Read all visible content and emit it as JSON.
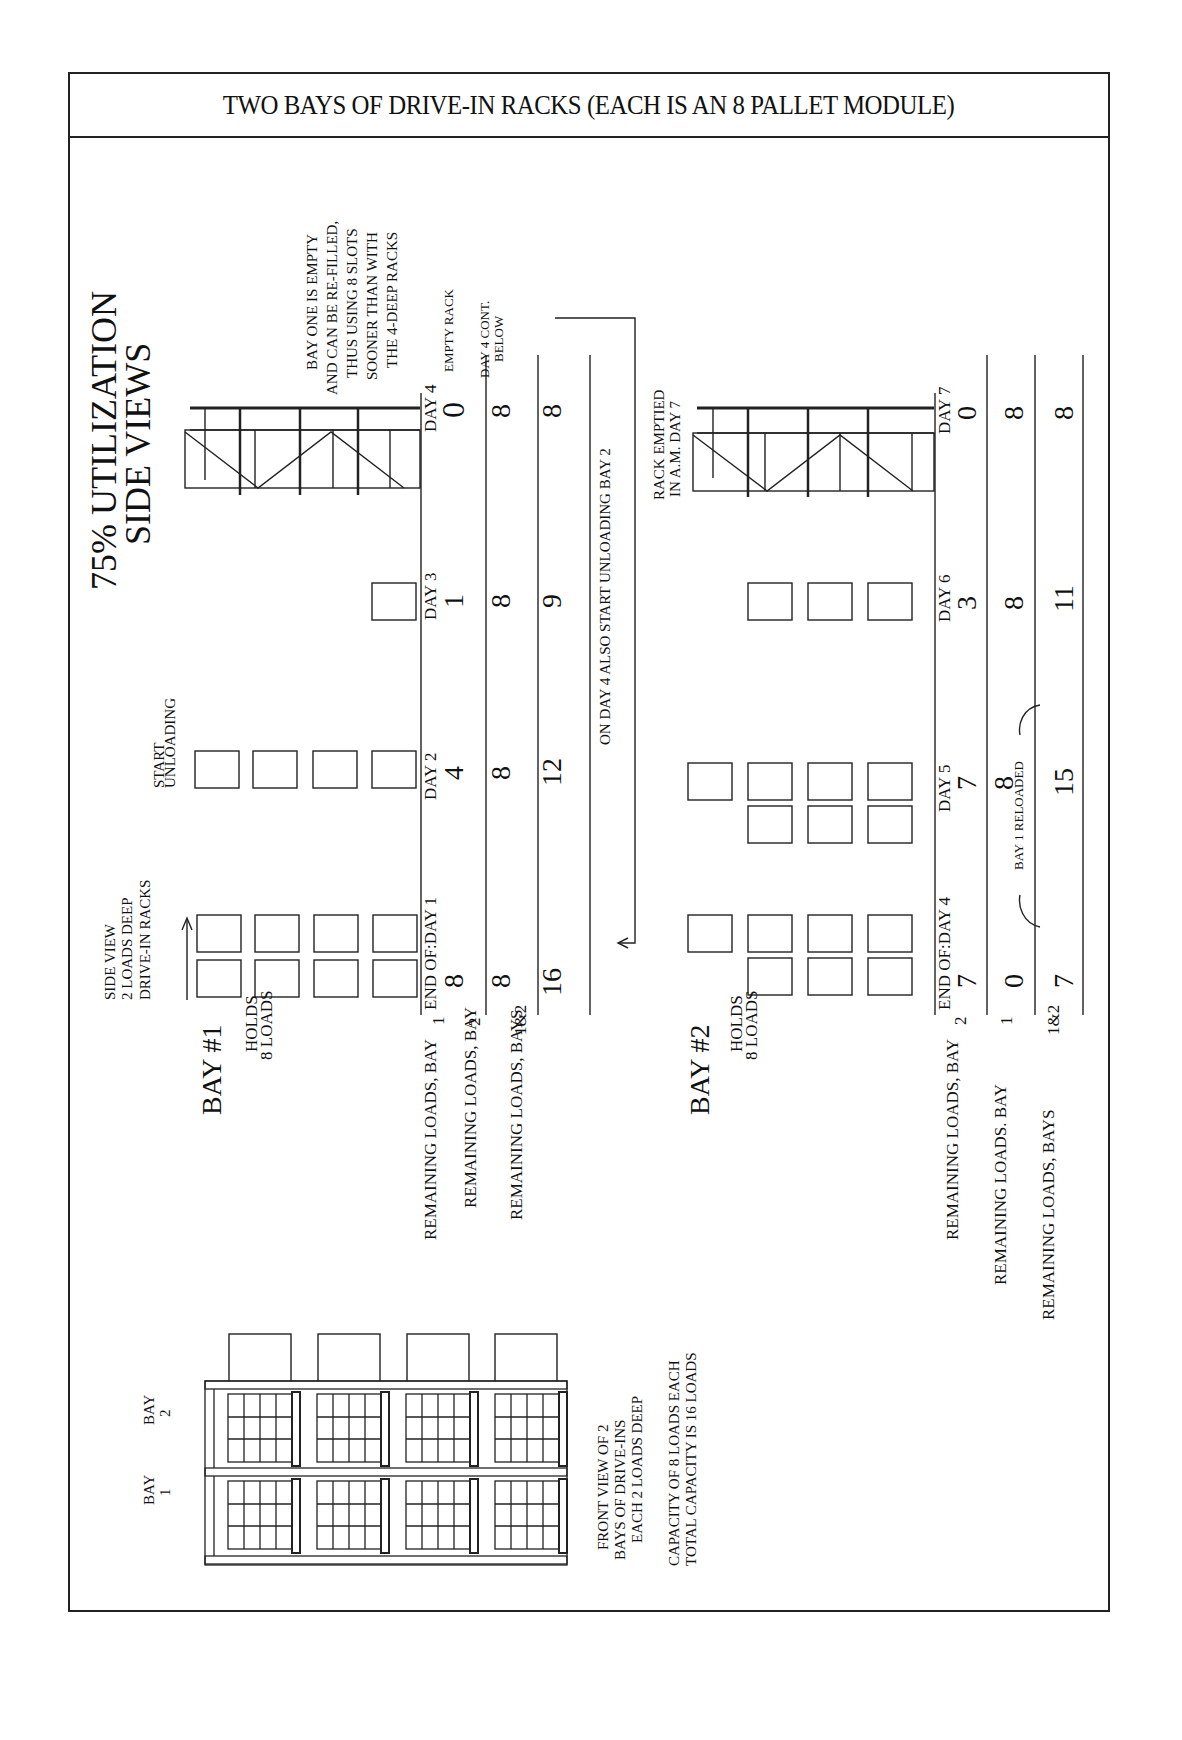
{
  "title": "TWO BAYS OF DRIVE-IN RACKS (EACH IS AN 8 PALLET MODULE)",
  "heading": {
    "line1": "75% UTILIZATION",
    "line2": "SIDE VIEWS"
  },
  "notes": {
    "side_view": [
      "SIDE VIEW",
      "2 LOADS DEEP",
      "DRIVE-IN RACKS"
    ],
    "start_unloading": [
      "START",
      "UNLOADING"
    ],
    "bay_one_empty": [
      "BAY ONE IS EMPTY",
      "AND CAN BE RE-FILLED,",
      "THUS USING 8 SLOTS",
      "SOONER THAN WITH",
      "THE 4-DEEP RACKS"
    ],
    "empty_rack": "EMPTY RACK",
    "day4_cont": [
      "DAY 4 CONT.",
      "BELOW"
    ],
    "on_day4": "ON DAY 4 ALSO START UNLOADING BAY 2",
    "rack_emptied": [
      "RACK EMPTIED",
      "IN A.M. DAY 7"
    ],
    "bay1_reloaded": "BAY 1 RELOADED",
    "front_view": [
      "FRONT VIEW OF 2",
      "BAYS OF DRIVE-INS",
      "EACH 2 LOADS DEEP"
    ],
    "capacity": [
      "CAPACITY OF 8 LOADS EACH",
      "TOTAL CAPACITY IS 16 LOADS"
    ]
  },
  "bay1": {
    "label": "BAY #1",
    "holds": [
      "HOLDS",
      "8 LOADS"
    ],
    "days": [
      "END OF:DAY 1",
      "DAY 2",
      "DAY 3",
      "DAY 4"
    ],
    "rows": [
      {
        "label": "REMAINING LOADS, BAY",
        "suffix": "1",
        "values": [
          "8",
          "4",
          "1",
          "0"
        ]
      },
      {
        "label": "REMAINING LOADS, BAY",
        "suffix": "2",
        "values": [
          "8",
          "8",
          "8",
          "8"
        ]
      },
      {
        "label": "REMAINING LOADS, BAYS",
        "suffix": "1&2",
        "values": [
          "16",
          "12",
          "9",
          "8"
        ]
      }
    ]
  },
  "bay2": {
    "label": "BAY #2",
    "holds": [
      "HOLDS",
      "8 LOADS"
    ],
    "days": [
      "END OF:DAY 4",
      "DAY 5",
      "DAY 6",
      "DAY 7"
    ],
    "rows": [
      {
        "label": "REMAINING LOADS, BAY",
        "suffix": "2",
        "values": [
          "7",
          "7",
          "3",
          "0"
        ]
      },
      {
        "label": "REMAINING LOADS. BAY",
        "suffix": "1",
        "values": [
          "0",
          "8",
          "8",
          "8"
        ]
      },
      {
        "label": "REMAINING LOADS, BAYS",
        "suffix": "1&2",
        "values": [
          "7",
          "15",
          "11",
          "8"
        ]
      }
    ]
  },
  "front": {
    "bay1_label": [
      "BAY",
      "1"
    ],
    "bay2_label": [
      "BAY",
      "2"
    ]
  }
}
